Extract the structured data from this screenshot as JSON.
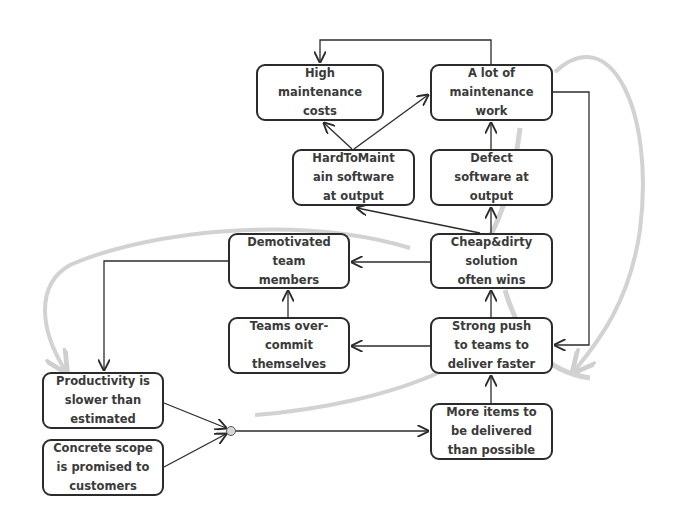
{
  "diagram": {
    "type": "causal-loop",
    "nodes": [
      {
        "id": "high_costs",
        "label": "High\nmaintenance\ncosts"
      },
      {
        "id": "lot_work",
        "label": "A lot of\nmaintenance\nwork"
      },
      {
        "id": "hard_to_maintain",
        "label": "HardToMaint\nain software\nat output"
      },
      {
        "id": "defect_sw",
        "label": "Defect\nsoftware at\noutput"
      },
      {
        "id": "demotivated",
        "label": "Demotivated\nteam\nmembers"
      },
      {
        "id": "cheap_dirty",
        "label": "Cheap&dirty\nsolution\noften wins"
      },
      {
        "id": "overcommit",
        "label": "Teams over-\ncommit\nthemselves"
      },
      {
        "id": "strong_push",
        "label": "Strong push\nto teams to\ndeliver faster"
      },
      {
        "id": "productivity",
        "label": "Productivity is\nslower than\nestimated"
      },
      {
        "id": "concrete_scope",
        "label": "Concrete scope\nis promised to\ncustomers"
      },
      {
        "id": "more_items",
        "label": "More items to\nbe delivered\nthan possible"
      }
    ],
    "edges": [
      {
        "from": "lot_work",
        "to": "high_costs"
      },
      {
        "from": "hard_to_maintain",
        "to": "high_costs"
      },
      {
        "from": "hard_to_maintain",
        "to": "lot_work"
      },
      {
        "from": "defect_sw",
        "to": "lot_work"
      },
      {
        "from": "cheap_dirty",
        "to": "defect_sw"
      },
      {
        "from": "cheap_dirty",
        "to": "hard_to_maintain"
      },
      {
        "from": "cheap_dirty",
        "to": "demotivated"
      },
      {
        "from": "strong_push",
        "to": "cheap_dirty"
      },
      {
        "from": "strong_push",
        "to": "overcommit"
      },
      {
        "from": "overcommit",
        "to": "demotivated"
      },
      {
        "from": "demotivated",
        "to": "productivity"
      },
      {
        "from": "lot_work",
        "to": "strong_push"
      },
      {
        "from": "productivity",
        "to": "junction"
      },
      {
        "from": "concrete_scope",
        "to": "junction"
      },
      {
        "from": "junction",
        "to": "more_items"
      },
      {
        "from": "more_items",
        "to": "strong_push"
      }
    ],
    "loops": [
      {
        "name": "maintenance-loop",
        "color": "#c8c8c8"
      },
      {
        "name": "demotivation-loop",
        "color": "#c8c8c8"
      }
    ],
    "colors": {
      "line": "#2b2b2b",
      "loop": "#cccccc",
      "text": "#3a3a3a"
    }
  }
}
